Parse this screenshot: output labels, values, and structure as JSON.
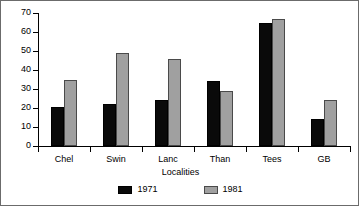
{
  "chart_data": {
    "type": "bar",
    "title": "",
    "subtitle": "",
    "xlabel": "Localities",
    "ylabel": "",
    "categories": [
      "Chel",
      "Swin",
      "Lanc",
      "Than",
      "Tees",
      "GB"
    ],
    "series": [
      {
        "name": "1971",
        "color": "#0a0a0a",
        "values": [
          20.5,
          22,
          24,
          34,
          65,
          14
        ]
      },
      {
        "name": "1981",
        "color": "#a0a0a0",
        "values": [
          35,
          49,
          46,
          29,
          67,
          24
        ]
      }
    ],
    "ylim": [
      0,
      70
    ],
    "ytick_values": [
      0,
      10,
      20,
      30,
      40,
      50,
      60,
      70
    ],
    "ytick_labels": [
      "0",
      "10",
      "20",
      "30",
      "40",
      "50",
      "60",
      "70"
    ],
    "grid": false,
    "legend_position": "bottom",
    "legend_entries": [
      "1971",
      "1981"
    ]
  }
}
